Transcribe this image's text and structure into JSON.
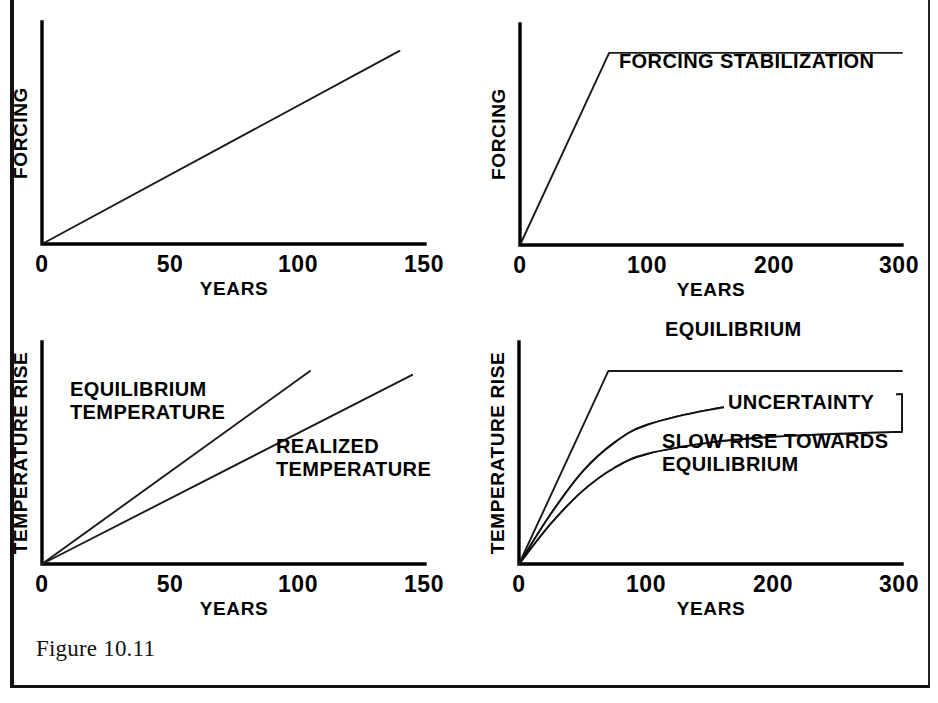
{
  "figure": {
    "caption": "Figure 10.11"
  },
  "chart_data": [
    {
      "id": "forcing-ramp",
      "type": "line",
      "panel_position": "top-left",
      "title": "",
      "xlabel": "YEARS",
      "ylabel": "FORCING",
      "xlim": [
        0,
        150
      ],
      "ylim": [
        0,
        1.15
      ],
      "xticks": [
        0,
        50,
        100,
        150
      ],
      "xtick_labels": [
        "0",
        "50",
        "100",
        "150"
      ],
      "yticks": [],
      "ytick_labels": [],
      "grid": false,
      "legend": "none",
      "series": [
        {
          "name": "forcing",
          "label": "",
          "x": [
            0,
            140
          ],
          "values": [
            0,
            1.0
          ]
        }
      ],
      "annotations": []
    },
    {
      "id": "forcing-stabilization",
      "type": "line",
      "panel_position": "top-right",
      "title": "",
      "xlabel": "YEARS",
      "ylabel": "FORCING",
      "xlim": [
        0,
        300
      ],
      "ylim": [
        0,
        1.15
      ],
      "xticks": [
        0,
        100,
        200,
        300
      ],
      "xtick_labels": [
        "0",
        "100",
        "200",
        "300"
      ],
      "yticks": [],
      "ytick_labels": [],
      "grid": false,
      "legend": "none",
      "series": [
        {
          "name": "forcing",
          "label": "",
          "x": [
            0,
            70,
            300
          ],
          "values": [
            0,
            1.0,
            1.0
          ]
        }
      ],
      "annotations": [
        {
          "text": "FORCING STABILIZATION",
          "x": 105,
          "y": 0.86
        }
      ]
    },
    {
      "id": "temperature-ramp",
      "type": "line",
      "panel_position": "bottom-left",
      "title": "",
      "xlabel": "YEARS",
      "ylabel": "TEMPERATURE RISE",
      "xlim": [
        0,
        150
      ],
      "ylim": [
        0,
        1.15
      ],
      "xticks": [
        0,
        50,
        100,
        150
      ],
      "xtick_labels": [
        "0",
        "50",
        "100",
        "150"
      ],
      "yticks": [],
      "ytick_labels": [],
      "grid": false,
      "legend": "inline-labels",
      "series": [
        {
          "name": "equilibrium-temperature",
          "label": "EQUILIBRIUM\nTEMPERATURE",
          "x": [
            0,
            105
          ],
          "values": [
            0,
            1.0
          ]
        },
        {
          "name": "realized-temperature",
          "label": "REALIZED\nTEMPERATURE",
          "x": [
            0,
            145
          ],
          "values": [
            0,
            0.98
          ]
        }
      ],
      "annotations": [
        {
          "text": "EQUILIBRIUM",
          "x": 14,
          "y": 0.8
        },
        {
          "text": "TEMPERATURE",
          "x": 14,
          "y": 0.7
        },
        {
          "text": "REALIZED",
          "x": 92,
          "y": 0.54
        },
        {
          "text": "TEMPERATURE",
          "x": 92,
          "y": 0.44
        }
      ]
    },
    {
      "id": "temperature-stabilization",
      "type": "area",
      "panel_position": "bottom-right",
      "title": "",
      "xlabel": "YEARS",
      "ylabel": "TEMPERATURE RISE",
      "xlim": [
        0,
        300
      ],
      "ylim": [
        0,
        1.15
      ],
      "xticks": [
        0,
        100,
        200,
        300
      ],
      "xtick_labels": [
        "0",
        "100",
        "200",
        "300"
      ],
      "yticks": [],
      "ytick_labels": [],
      "grid": false,
      "legend": "inline-labels",
      "series": [
        {
          "name": "equilibrium",
          "label": "EQUILIBRIUM",
          "x": [
            0,
            70,
            300
          ],
          "values": [
            0,
            1.0,
            1.0
          ]
        },
        {
          "name": "uncertainty-upper",
          "label": "UNCERTAINTY",
          "x": [
            0,
            25,
            50,
            75,
            100,
            150,
            200,
            250,
            300
          ],
          "values": [
            0,
            0.26,
            0.48,
            0.63,
            0.72,
            0.8,
            0.84,
            0.86,
            0.88
          ]
        },
        {
          "name": "uncertainty-lower",
          "label": "SLOW RISE TOWARDS EQUILIBRIUM",
          "x": [
            0,
            25,
            50,
            75,
            100,
            150,
            200,
            250,
            300
          ],
          "values": [
            0,
            0.21,
            0.38,
            0.5,
            0.57,
            0.63,
            0.66,
            0.675,
            0.685
          ]
        }
      ],
      "annotations": [
        {
          "text": "EQUILIBRIUM",
          "x": 115,
          "y": 1.08
        },
        {
          "text": "UNCERTAINTY",
          "x": 172,
          "y": 0.73
        },
        {
          "text": "SLOW RISE TOWARDS",
          "x": 112,
          "y": 0.42
        },
        {
          "text": "EQUILIBRIUM",
          "x": 112,
          "y": 0.32
        }
      ]
    }
  ]
}
